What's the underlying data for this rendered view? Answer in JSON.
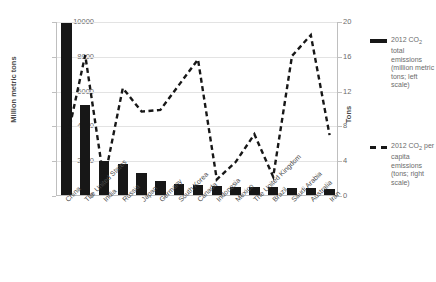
{
  "chart_data": {
    "type": "bar",
    "title": "",
    "subtitle": "",
    "xlabel": "",
    "ylabel": "Million metric tons",
    "y2label": "Tons",
    "ylim": [
      0,
      10000
    ],
    "y2lim": [
      0,
      20
    ],
    "yticks": [
      0,
      2000,
      4000,
      6000,
      8000,
      10000
    ],
    "y2ticks": [
      0,
      4,
      8,
      12,
      16,
      20
    ],
    "grid": true,
    "legend_position": "right",
    "categories": [
      "China",
      "The United States",
      "India",
      "Russia",
      "Japan",
      "Germany",
      "South Korea",
      "Canada",
      "Indonesia",
      "Mexico",
      "The United Kingdom",
      "Brazil",
      "Saudi Arabia",
      "Australia",
      "Iran"
    ],
    "series": [
      {
        "name": "2012 CO2 total emissions (million metric tons; left scale)",
        "type": "bar",
        "axis": "left",
        "color": "#171717",
        "values": [
          9860,
          5190,
          1970,
          1770,
          1240,
          810,
          640,
          550,
          510,
          470,
          450,
          440,
          430,
          390,
          370
        ]
      },
      {
        "name": "2012 CO2 per capita emissions (tons; right scale)",
        "type": "line",
        "axis": "right",
        "style": "dashed",
        "color": "#171717",
        "values": [
          6.2,
          16.2,
          1.7,
          12.4,
          9.7,
          9.9,
          12.8,
          15.7,
          1.9,
          3.9,
          7.1,
          2.2,
          16.1,
          18.5,
          7.0
        ]
      }
    ]
  },
  "legend": {
    "entries": [
      {
        "swatch": "solid-bar",
        "line1": "2012 CO",
        "sub1": "2",
        "line2": " total emissions (million metric tons; left scale)"
      },
      {
        "swatch": "dashed-line",
        "line1": "2012 CO",
        "sub1": "2",
        "line2": " per capita emissions (tons; right scale)"
      }
    ]
  },
  "axes": {
    "left_title": "Million metric tons",
    "right_title": "Tons",
    "left_ticks": [
      "10000",
      "8000",
      "6000",
      "4000",
      "2000",
      "0"
    ],
    "right_ticks": [
      "20",
      "16",
      "12",
      "8",
      "4",
      "0"
    ]
  }
}
